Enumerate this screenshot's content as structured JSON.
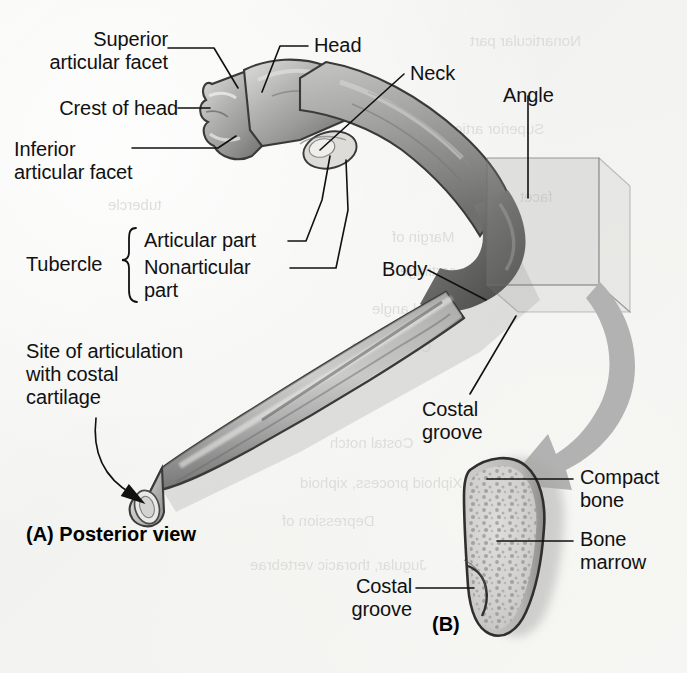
{
  "figure": {
    "background_color": "#f4f4f2",
    "ink_color": "#111111",
    "highlight_color": "#b2b2b2"
  },
  "panels": [
    {
      "id": "A",
      "caption": "(A) Posterior view"
    },
    {
      "id": "B",
      "caption": "(B)"
    }
  ],
  "labels": {
    "superior_articular_facet": "Superior\narticular facet",
    "crest_of_head": "Crest of head",
    "inferior_articular_facet": "Inferior\narticular facet",
    "head": "Head",
    "neck": "Neck",
    "angle": "Angle",
    "tubercle": "Tubercle",
    "articular_part": "Articular part",
    "nonarticular_part": "Nonarticular\npart",
    "body": "Body",
    "costal_groove_a": "Costal\ngroove",
    "site_of_articulation": "Site of articulation\nwith costal\ncartilage",
    "panel_a_caption": "(A) Posterior view",
    "compact_bone": "Compact\nbone",
    "bone_marrow": "Bone\nmarrow",
    "costal_groove_b": "Costal\ngroove",
    "panel_b_caption": "(B)"
  },
  "ghost_text": [
    {
      "text": "Nonarticular part",
      "x": 470,
      "y": 32
    },
    {
      "text": "Superior articular",
      "x": 430,
      "y": 120
    },
    {
      "text": "Margin of",
      "x": 392,
      "y": 228
    },
    {
      "text": "cartilage",
      "x": 400,
      "y": 262
    },
    {
      "text": "Sternal angle",
      "x": 372,
      "y": 300
    },
    {
      "text": "Costal facet",
      "x": 352,
      "y": 338
    },
    {
      "text": "Costal notch",
      "x": 330,
      "y": 434
    },
    {
      "text": "Xiphoid process, xiphoid",
      "x": 300,
      "y": 474
    },
    {
      "text": "Depression of",
      "x": 282,
      "y": 512
    },
    {
      "text": "Jugular, thoracic vertebrae",
      "x": 250,
      "y": 556
    },
    {
      "text": "tubercle",
      "x": 108,
      "y": 196
    },
    {
      "text": "facet",
      "x": 520,
      "y": 188
    }
  ],
  "icons": {
    "big_callout_arrow": "curved-arrow-icon",
    "site_pointer_arrow": "curved-arrow-icon",
    "tubercle_brace": "curly-brace-icon",
    "highlight_box": "magnify-region-icon"
  }
}
